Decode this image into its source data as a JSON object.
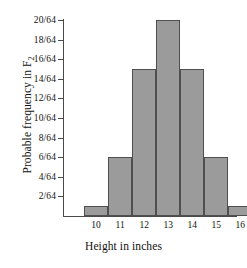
{
  "chart_data": {
    "type": "bar",
    "title": "",
    "xlabel": "Height in inches",
    "ylabel": "Probable frequency in F",
    "ylabel_subscript": "2",
    "categories": [
      "10",
      "11",
      "12",
      "13",
      "14",
      "15",
      "16"
    ],
    "values": [
      1,
      6,
      15,
      20,
      15,
      6,
      1
    ],
    "value_labels": [
      "1/64",
      "6/64",
      "15/64",
      "20/64",
      "15/64",
      "6/64",
      "1/64"
    ],
    "ytick_labels": [
      "2/64",
      "4/64",
      "6/64",
      "8/64",
      "10/64",
      "12/64",
      "14/64",
      "16/64",
      "18/64",
      "20/64"
    ],
    "ytick_values": [
      2,
      4,
      6,
      8,
      10,
      12,
      14,
      16,
      18,
      20
    ],
    "ylim": [
      0,
      20
    ],
    "y_denominator": 64,
    "grid": false,
    "legend": false,
    "bar_fill_color": "#9b9b9b",
    "bar_edge_color": "#4f4f4f",
    "axis_color": "#4a4a4a",
    "background_color": "#ffffff"
  }
}
